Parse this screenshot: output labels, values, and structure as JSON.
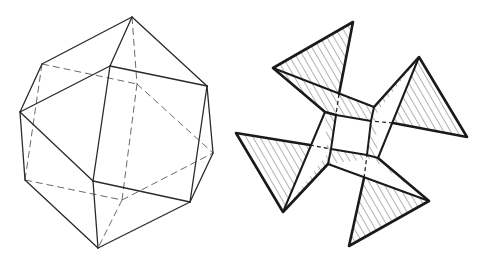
{
  "figures": [
    {
      "id": "left",
      "label": "Wireframe polyhedron (cuboctahedron-like solid) with hidden edges dashed",
      "visible_edges": [
        [
          [
            132,
            17
          ],
          [
            42,
            64
          ]
        ],
        [
          [
            132,
            17
          ],
          [
            110,
            66
          ]
        ],
        [
          [
            132,
            17
          ],
          [
            207,
            86
          ]
        ],
        [
          [
            42,
            64
          ],
          [
            20,
            112
          ]
        ],
        [
          [
            20,
            112
          ],
          [
            110,
            66
          ]
        ],
        [
          [
            110,
            66
          ],
          [
            207,
            86
          ]
        ],
        [
          [
            207,
            86
          ],
          [
            213,
            153
          ]
        ],
        [
          [
            207,
            86
          ],
          [
            190,
            202
          ]
        ],
        [
          [
            213,
            153
          ],
          [
            190,
            202
          ]
        ],
        [
          [
            20,
            112
          ],
          [
            25,
            180
          ]
        ],
        [
          [
            20,
            112
          ],
          [
            93,
            181
          ]
        ],
        [
          [
            110,
            66
          ],
          [
            93,
            181
          ]
        ],
        [
          [
            93,
            181
          ],
          [
            190,
            202
          ]
        ],
        [
          [
            93,
            181
          ],
          [
            98,
            248
          ]
        ],
        [
          [
            25,
            180
          ],
          [
            98,
            248
          ]
        ],
        [
          [
            98,
            248
          ],
          [
            190,
            202
          ]
        ]
      ],
      "hidden_edges": [
        [
          [
            132,
            17
          ],
          [
            137,
            84
          ]
        ],
        [
          [
            42,
            64
          ],
          [
            137,
            84
          ]
        ],
        [
          [
            137,
            84
          ],
          [
            213,
            153
          ]
        ],
        [
          [
            137,
            84
          ],
          [
            122,
            200
          ]
        ],
        [
          [
            42,
            64
          ],
          [
            25,
            180
          ]
        ],
        [
          [
            25,
            180
          ],
          [
            122,
            200
          ]
        ],
        [
          [
            122,
            200
          ],
          [
            213,
            153
          ]
        ],
        [
          [
            122,
            200
          ],
          [
            98,
            248
          ]
        ]
      ]
    },
    {
      "id": "right",
      "label": "Pinwheel of four hatched triangular flaps around a central square",
      "center_square": [
        [
          336,
          115
        ],
        [
          371,
          121
        ],
        [
          367,
          155
        ],
        [
          331,
          149
        ]
      ],
      "outer_square": [
        [
          325,
          112
        ],
        [
          374,
          107
        ],
        [
          378,
          158
        ],
        [
          328,
          164
        ]
      ]
    }
  ]
}
